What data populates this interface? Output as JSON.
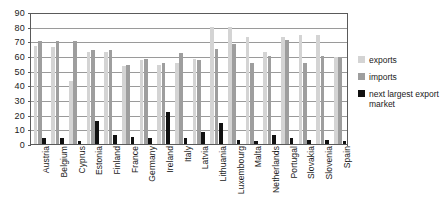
{
  "chart_data": {
    "type": "bar",
    "title": "",
    "subtitle": "",
    "xlabel": "",
    "ylabel": "",
    "ylim": [
      0,
      90
    ],
    "ytick_step": 10,
    "yticks": [
      0,
      10,
      20,
      30,
      40,
      50,
      60,
      70,
      80,
      90
    ],
    "ytick_labels": [
      "0",
      "10",
      "20",
      "30",
      "40",
      "50",
      "60",
      "70",
      "80",
      "90"
    ],
    "grid": true,
    "grid_axis": "y",
    "legend_position": "right",
    "categories": [
      "Austria",
      "Belgium",
      "Cyprus",
      "Estonia",
      "Finland",
      "France",
      "Germany",
      "Ireland",
      "Italy",
      "Latvia",
      "Lithuania",
      "Luxembourg",
      "Malta",
      "Netherlands",
      "Portugal",
      "Slovakia",
      "Slovenia",
      "Spain"
    ],
    "series": [
      {
        "name": "exports",
        "color": "#d4d4d4",
        "values": [
          67,
          66,
          43,
          63,
          63,
          53,
          57,
          54,
          55,
          58,
          80,
          80,
          73,
          63,
          73,
          74,
          74,
          59
        ]
      },
      {
        "name": "imports",
        "color": "#9e9e9e",
        "values": [
          70,
          70,
          70,
          64,
          64,
          54,
          58,
          55,
          62,
          57,
          65,
          68,
          55,
          60,
          71,
          55,
          60,
          59
        ]
      },
      {
        "name": "next largest export market",
        "color": "#111111",
        "values": [
          4,
          4,
          2,
          16,
          6,
          5,
          4,
          22,
          4,
          8,
          14,
          3,
          2,
          6,
          4,
          3,
          3,
          2
        ]
      }
    ]
  },
  "legend": {
    "items": [
      {
        "label": "exports",
        "icon": "square-swatch-icon",
        "color": "#d4d4d4"
      },
      {
        "label": "imports",
        "icon": "square-swatch-icon",
        "color": "#9e9e9e"
      },
      {
        "label": "next largest export market",
        "icon": "square-swatch-icon",
        "color": "#111111"
      }
    ]
  }
}
